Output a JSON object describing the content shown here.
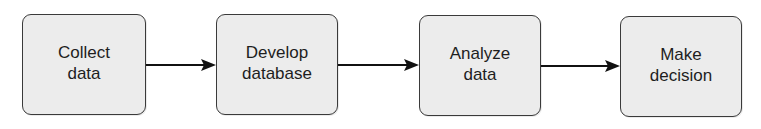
{
  "diagram": {
    "type": "flowchart",
    "direction": "left-to-right",
    "nodes": [
      {
        "id": "collect",
        "label": "Collect\ndata"
      },
      {
        "id": "develop",
        "label": "Develop\ndatabase"
      },
      {
        "id": "analyze",
        "label": "Analyze\ndata"
      },
      {
        "id": "decide",
        "label": "Make\ndecision"
      }
    ],
    "edges": [
      {
        "from": "collect",
        "to": "develop"
      },
      {
        "from": "develop",
        "to": "analyze"
      },
      {
        "from": "analyze",
        "to": "decide"
      }
    ],
    "colors": {
      "box_fill": "#ececec",
      "box_border": "#3a3a3a",
      "arrow": "#111111",
      "text": "#1e1e1e"
    }
  }
}
